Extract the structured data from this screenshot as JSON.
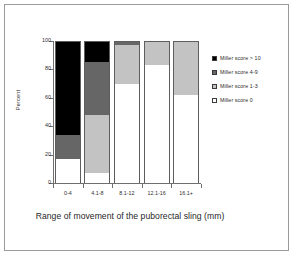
{
  "figure": {
    "caption": "Range of movement of the puborectal sling (mm)",
    "background_color": "#ffffff",
    "frame_color": "#9a9a9a"
  },
  "chart_data": {
    "type": "bar",
    "subtype": "stacked-100-percent",
    "title": "",
    "subtitle": "",
    "xlabel": "Range of movement of the puborectal sling (mm)",
    "ylabel": "Percent",
    "ylim": [
      0,
      100
    ],
    "yticks": [
      0,
      20,
      40,
      60,
      80,
      100
    ],
    "ytick_labels": [
      "0",
      "20",
      "40",
      "60",
      "80",
      "100"
    ],
    "grid": false,
    "legend_position": "right",
    "categories": [
      "0-4",
      "4.1-8",
      "8.1-12",
      "12.1-16",
      "16.1+"
    ],
    "series": [
      {
        "name": "Miller score     0",
        "color": "#ffffff",
        "values": [
          17,
          7,
          70,
          83,
          62
        ]
      },
      {
        "name": "Miller score  1-3",
        "color": "#c3c3c3",
        "values": [
          0,
          41,
          27,
          17,
          38
        ]
      },
      {
        "name": "Miller score  4-9",
        "color": "#666666",
        "values": [
          17,
          37,
          3,
          0,
          0
        ]
      },
      {
        "name": "Miller score > 10",
        "color": "#000000",
        "values": [
          66,
          15,
          0,
          0,
          0
        ]
      }
    ],
    "legend_entries": [
      {
        "label": "Miller score > 10",
        "color": "#000000"
      },
      {
        "label": "Miller score  4-9",
        "color": "#666666"
      },
      {
        "label": "Miller score  1-3",
        "color": "#c3c3c3"
      },
      {
        "label": "Miller score     0",
        "color": "#ffffff"
      }
    ]
  },
  "axes": {
    "y_title": "Percent",
    "y_tick_labels": [
      "100",
      "80",
      "60",
      "40",
      "20",
      "0"
    ],
    "x_tick_labels": [
      "0-4",
      "4.1-8",
      "8.1-12",
      "12.1-16",
      "16.1+"
    ]
  }
}
